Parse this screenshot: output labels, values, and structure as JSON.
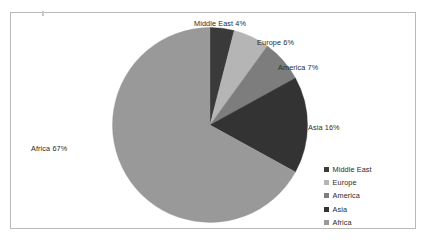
{
  "chart_data": {
    "type": "pie",
    "title": "",
    "categories": [
      "Middle East",
      "Europe",
      "America",
      "Asia",
      "Africa"
    ],
    "values": [
      4,
      6,
      7,
      16,
      67
    ],
    "unit": "%",
    "legend_position": "bottom-right",
    "grid": false,
    "start_angle_deg": 0,
    "direction": "clockwise",
    "slices": [
      {
        "label": "Middle East",
        "value": 4,
        "display": "Middle East 4%",
        "color": "#3a3a3a"
      },
      {
        "label": "Europe",
        "value": 6,
        "display": "Europe 6%",
        "color": "#b5b5b5"
      },
      {
        "label": "America",
        "value": 7,
        "display": "America 7%",
        "color": "#7d7d7d"
      },
      {
        "label": "Asia",
        "value": 16,
        "display": "Asia 16%",
        "color": "#333333"
      },
      {
        "label": "Africa",
        "value": 67,
        "display": "Africa 67%",
        "color": "#999999"
      }
    ]
  },
  "labels": {
    "middle_east": "Middle East 4%",
    "europe": "Europe 6%",
    "america": "America 7%",
    "asia": "Asia 16%",
    "africa": "Africa 67%"
  },
  "legend": {
    "items": [
      {
        "label": "Middle East",
        "color": "#3a3a3a"
      },
      {
        "label": "Europe",
        "color": "#b5b5b5"
      },
      {
        "label": "America",
        "color": "#7d7d7d"
      },
      {
        "label": "Asia",
        "color": "#333333"
      },
      {
        "label": "Africa",
        "color": "#999999"
      }
    ]
  },
  "frame": {
    "border_color": "#b9b9b9",
    "background": "#ffffff"
  }
}
